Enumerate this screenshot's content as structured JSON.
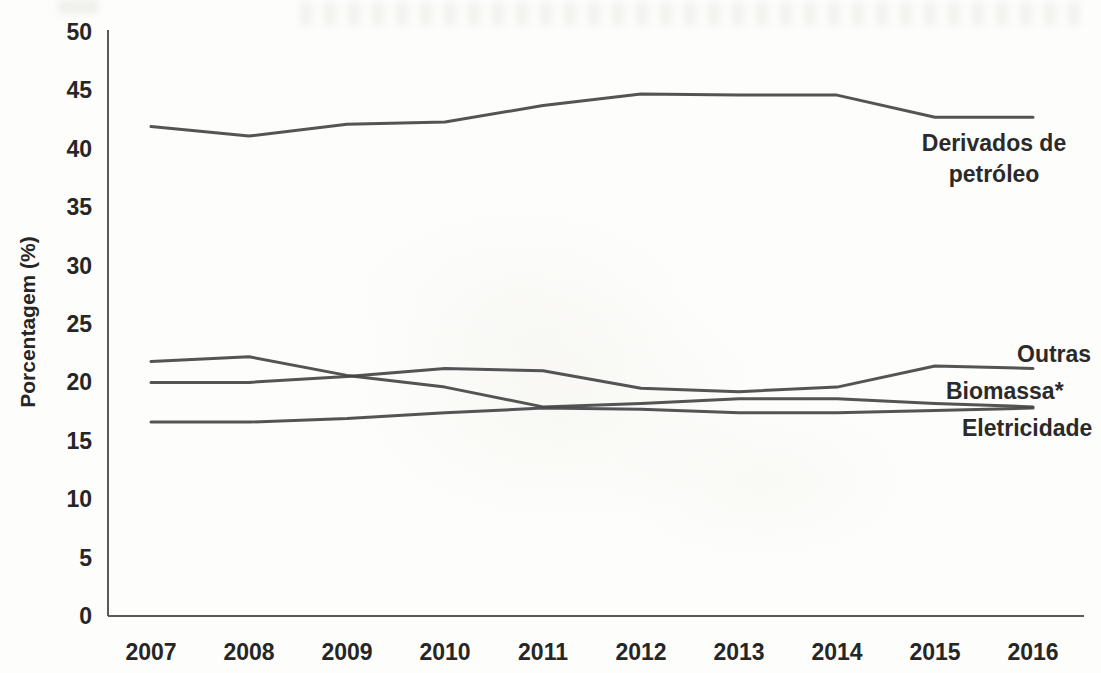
{
  "chart_data": {
    "type": "line",
    "title": "",
    "xlabel": "",
    "ylabel": "Porcentagem (%)",
    "ylim": [
      0,
      50
    ],
    "ytick_step": 5,
    "grid": false,
    "legend_position": "end-of-line-labels",
    "categories": [
      "2007",
      "2008",
      "2009",
      "2010",
      "2011",
      "2012",
      "2013",
      "2014",
      "2015",
      "2016"
    ],
    "series": [
      {
        "name": "Derivados de petróleo",
        "values": [
          41.9,
          41.1,
          42.1,
          42.3,
          43.7,
          44.7,
          44.6,
          44.6,
          42.7,
          42.7
        ]
      },
      {
        "name": "Outras",
        "values": [
          20.0,
          20.0,
          20.5,
          21.2,
          21.0,
          19.5,
          19.2,
          19.6,
          21.4,
          21.2
        ]
      },
      {
        "name": "Biomassa*",
        "values": [
          21.8,
          22.2,
          20.6,
          19.6,
          17.9,
          18.2,
          18.6,
          18.6,
          18.2,
          17.9
        ]
      },
      {
        "name": "Eletricidade",
        "values": [
          16.6,
          16.6,
          16.9,
          17.4,
          17.8,
          17.7,
          17.4,
          17.4,
          17.6,
          17.8
        ]
      }
    ],
    "y_ticks": [
      "0",
      "5",
      "10",
      "15",
      "20",
      "25",
      "30",
      "35",
      "40",
      "45",
      "50"
    ],
    "colors": {
      "line": "#454545",
      "axis": "#595959",
      "text": "#262626"
    }
  },
  "labels": {
    "y_axis_title": "Porcentagem (%)",
    "derivados_line1": "Derivados de",
    "derivados_line2": "petróleo",
    "outras": "Outras",
    "biomassa": "Biomassa*",
    "eletricidade": "Eletricidade"
  }
}
